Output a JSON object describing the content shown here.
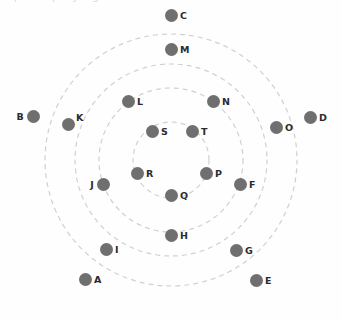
{
  "diagram": {
    "background_color": "#fefefe",
    "node_color": "#6f6f6f",
    "label_color": "#2b2b2b",
    "ring_color": "#d2cfd0",
    "center": {
      "x": 171,
      "y": 160
    },
    "node_radius_px": 6.5,
    "cropped_top_text": "p  .        p  y  g",
    "rings": [
      {
        "name": "ring-inner",
        "radius": 38
      },
      {
        "name": "ring-second",
        "radius": 72
      },
      {
        "name": "ring-third",
        "radius": 96
      },
      {
        "name": "ring-outer",
        "radius": 126
      }
    ],
    "nodes": [
      {
        "label": "A",
        "x": 85,
        "y": 279,
        "label_side": "right"
      },
      {
        "label": "B",
        "x": 33,
        "y": 116,
        "label_side": "left"
      },
      {
        "label": "C",
        "x": 171,
        "y": 15,
        "label_side": "right"
      },
      {
        "label": "D",
        "x": 310,
        "y": 117,
        "label_side": "right"
      },
      {
        "label": "E",
        "x": 256,
        "y": 280,
        "label_side": "right"
      },
      {
        "label": "F",
        "x": 240,
        "y": 184,
        "label_side": "right"
      },
      {
        "label": "G",
        "x": 236,
        "y": 250,
        "label_side": "right"
      },
      {
        "label": "H",
        "x": 171,
        "y": 235,
        "label_side": "right"
      },
      {
        "label": "I",
        "x": 106,
        "y": 249,
        "label_side": "right"
      },
      {
        "label": "J",
        "x": 103,
        "y": 184,
        "label_side": "left"
      },
      {
        "label": "K",
        "x": 68,
        "y": 124,
        "label_side": "ne"
      },
      {
        "label": "L",
        "x": 128,
        "y": 101,
        "label_side": "right"
      },
      {
        "label": "M",
        "x": 171,
        "y": 49,
        "label_side": "right"
      },
      {
        "label": "N",
        "x": 213,
        "y": 101,
        "label_side": "right"
      },
      {
        "label": "O",
        "x": 276,
        "y": 127,
        "label_side": "right"
      },
      {
        "label": "P",
        "x": 206,
        "y": 173,
        "label_side": "right"
      },
      {
        "label": "Q",
        "x": 171,
        "y": 195,
        "label_side": "right"
      },
      {
        "label": "R",
        "x": 137,
        "y": 173,
        "label_side": "right"
      },
      {
        "label": "S",
        "x": 152,
        "y": 131,
        "label_side": "right"
      },
      {
        "label": "T",
        "x": 192,
        "y": 131,
        "label_side": "right"
      }
    ]
  }
}
